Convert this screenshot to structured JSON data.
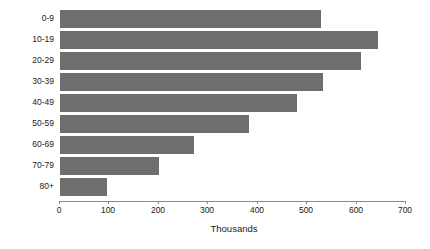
{
  "chart_data": {
    "type": "bar",
    "orientation": "horizontal",
    "title": "",
    "subtitle": "",
    "xlabel": "Thousands",
    "ylabel": "",
    "categories": [
      "0-9",
      "10-19",
      "20-29",
      "30-39",
      "40-49",
      "50-59",
      "60-69",
      "70-79",
      "80+"
    ],
    "values": [
      525,
      642,
      607,
      530,
      478,
      380,
      270,
      198,
      93
    ],
    "series": [
      {
        "name": "Population",
        "values": [
          525,
          642,
          607,
          530,
          478,
          380,
          270,
          198,
          93
        ]
      }
    ],
    "xlim": [
      0,
      700
    ],
    "xticks": [
      0,
      100,
      200,
      300,
      400,
      500,
      600,
      700
    ],
    "xtick_labels": [
      "0",
      "100",
      "200",
      "300",
      "400",
      "500",
      "600",
      "700"
    ],
    "grid": false,
    "legend": false,
    "legend_position": "none",
    "bar_color": "#6e6e6e",
    "background_color": "#ffffff",
    "axis_color": "#8a8a8a",
    "text_color": "#1a1a1a",
    "units": "Thousands"
  }
}
